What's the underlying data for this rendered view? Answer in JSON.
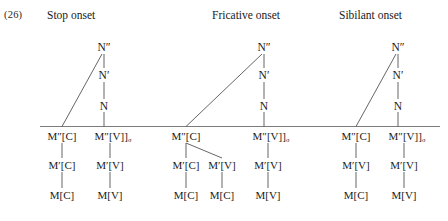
{
  "figure": {
    "example_number": "(26)",
    "background_color": "#ffffff",
    "ink_color": "#1a1a1a",
    "line_color": "#4a4a4a"
  },
  "panels": [
    {
      "id": "stop",
      "title": "Stop onset",
      "nucleus_projection": {
        "n_double_bar": "N″",
        "n_single_bar": "N′",
        "n_bar": "N"
      },
      "melody_columns": [
        {
          "id": "stop-consonant",
          "top": "M″[C]",
          "mid": "M′[C]",
          "bottom": "M[C]"
        },
        {
          "id": "stop-vowel",
          "top": "M″[V]]",
          "top_subscript": "σ",
          "mid": "M′[V]",
          "bottom": "M[V]"
        }
      ]
    },
    {
      "id": "fricative",
      "title": "Fricative onset",
      "nucleus_projection": {
        "n_double_bar": "N″",
        "n_single_bar": "N′",
        "n_bar": "N"
      },
      "melody_columns": [
        {
          "id": "fricative-consonant",
          "top": "M″[C]",
          "mid": "M′[C]",
          "bottom": "M[C]"
        },
        {
          "id": "fricative-consonant-branch",
          "top": "",
          "mid": "M′[V]",
          "bottom": "M[C]"
        },
        {
          "id": "fricative-vowel",
          "top": "M″[V]]",
          "top_subscript": "σ",
          "mid": "M′[V]",
          "bottom": "M[V]"
        }
      ]
    },
    {
      "id": "sibilant",
      "title": "Sibilant onset",
      "nucleus_projection": {
        "n_double_bar": "N″",
        "n_single_bar": "N′",
        "n_bar": "N"
      },
      "melody_columns": [
        {
          "id": "sibilant-consonant",
          "top": "M″[C]",
          "mid": "M′[V]",
          "bottom": "M[C]"
        },
        {
          "id": "sibilant-vowel",
          "top": "M″[V]]",
          "top_subscript": "σ",
          "mid": "M′[V]",
          "bottom": "M[V]"
        }
      ]
    }
  ]
}
